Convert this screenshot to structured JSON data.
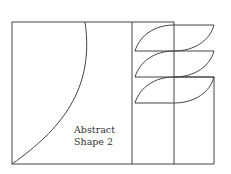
{
  "diagram": {
    "title": "Abstract Shape 2",
    "label_line1": "Abstract",
    "label_line2": "Shape 2",
    "stroke_color": "#444444",
    "background": "#ffffff"
  }
}
